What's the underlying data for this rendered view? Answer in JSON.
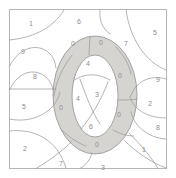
{
  "image": {
    "kind": "color-by-number-puzzle",
    "width": 176,
    "height": 178
  },
  "colors": {
    "background": "#ffffff",
    "frame_border": "#b6b6b6",
    "region_outline": "#9b9b9b",
    "shaded_fill": "#d6d4d1",
    "unshaded_fill": "#ffffff",
    "label_text": "#8d8d8d"
  },
  "frame": {
    "x": 9,
    "y": 9,
    "width": 158,
    "height": 160
  },
  "regions": [
    {
      "id": "r-top-left-1",
      "label": "1",
      "x": 31,
      "y": 23,
      "shaded": false
    },
    {
      "id": "r-left-9",
      "label": "9",
      "x": 23,
      "y": 51,
      "shaded": false
    },
    {
      "id": "r-left-8",
      "label": "8",
      "x": 35,
      "y": 76,
      "shaded": false
    },
    {
      "id": "r-left-5",
      "label": "5",
      "x": 24,
      "y": 106,
      "shaded": false
    },
    {
      "id": "r-left-2",
      "label": "2",
      "x": 25,
      "y": 148,
      "shaded": false
    },
    {
      "id": "r-top-6",
      "label": "6",
      "x": 79,
      "y": 21,
      "shaded": false
    },
    {
      "id": "r-ring-top-left-0",
      "label": "0",
      "x": 73,
      "y": 43,
      "shaded": true
    },
    {
      "id": "r-ring-top-right-0",
      "label": "0",
      "x": 101,
      "y": 42,
      "shaded": true
    },
    {
      "id": "r-upper-right-7",
      "label": "7",
      "x": 126,
      "y": 43,
      "shaded": false
    },
    {
      "id": "r-right-5",
      "label": "5",
      "x": 155,
      "y": 32,
      "shaded": false
    },
    {
      "id": "r-ring-right-0",
      "label": "0",
      "x": 120,
      "y": 75,
      "shaded": true
    },
    {
      "id": "r-right-9",
      "label": "9",
      "x": 158,
      "y": 79,
      "shaded": false
    },
    {
      "id": "r-right-2",
      "label": "2",
      "x": 150,
      "y": 103,
      "shaded": false
    },
    {
      "id": "r-right-8",
      "label": "8",
      "x": 158,
      "y": 127,
      "shaded": false
    },
    {
      "id": "r-ring-left-0",
      "label": "0",
      "x": 61,
      "y": 107,
      "shaded": true
    },
    {
      "id": "r-ring-lower-right-0",
      "label": "0",
      "x": 119,
      "y": 114,
      "shaded": true
    },
    {
      "id": "r-inner-top-4",
      "label": "4",
      "x": 88,
      "y": 63,
      "shaded": false
    },
    {
      "id": "r-inner-left-4",
      "label": "4",
      "x": 78,
      "y": 98,
      "shaded": false
    },
    {
      "id": "r-inner-3",
      "label": "3",
      "x": 97,
      "y": 94,
      "shaded": false
    },
    {
      "id": "r-inner-6",
      "label": "6",
      "x": 91,
      "y": 126,
      "shaded": false
    },
    {
      "id": "r-ring-bottom-0",
      "label": "0",
      "x": 97,
      "y": 144,
      "shaded": true
    },
    {
      "id": "r-bottom-7",
      "label": "7",
      "x": 61,
      "y": 163,
      "shaded": false
    },
    {
      "id": "r-bottom-3",
      "label": "3",
      "x": 103,
      "y": 167,
      "shaded": false
    },
    {
      "id": "r-bottom-right-1",
      "label": "1",
      "x": 144,
      "y": 149,
      "shaded": false
    }
  ]
}
